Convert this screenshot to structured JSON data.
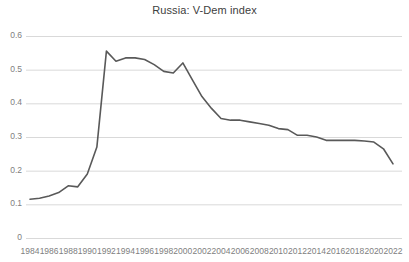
{
  "chart_data": {
    "type": "line",
    "title": "Russia: V-Dem index",
    "xlabel": "",
    "ylabel": "",
    "xlim": [
      1984,
      2022
    ],
    "ylim": [
      0,
      0.6
    ],
    "grid": true,
    "legend": false,
    "line_color": "#595959",
    "grid_color": "#d9d9d9",
    "tick_color": "#808080",
    "title_color": "#404040",
    "ytick_labels": [
      "0.6",
      "0.5",
      "0.4",
      "0.3",
      "0.2",
      "0.1",
      "0"
    ],
    "ytick_values": [
      0.6,
      0.5,
      0.4,
      0.3,
      0.2,
      0.1,
      0
    ],
    "xtick_labels": [
      "1984",
      "1986",
      "1988",
      "1990",
      "1992",
      "1994",
      "1996",
      "1998",
      "2000",
      "2002",
      "2004",
      "2006",
      "2008",
      "2010",
      "2012",
      "2014",
      "2016",
      "2018",
      "2020",
      "2022"
    ],
    "xtick_values": [
      1984,
      1986,
      1988,
      1990,
      1992,
      1994,
      1996,
      1998,
      2000,
      2002,
      2004,
      2006,
      2008,
      2010,
      2012,
      2014,
      2016,
      2018,
      2020,
      2022
    ],
    "x": [
      1984,
      1985,
      1986,
      1987,
      1988,
      1989,
      1990,
      1991,
      1992,
      1993,
      1994,
      1995,
      1996,
      1997,
      1998,
      1999,
      2000,
      2001,
      2002,
      2003,
      2004,
      2005,
      2006,
      2007,
      2008,
      2009,
      2010,
      2011,
      2012,
      2013,
      2014,
      2015,
      2016,
      2017,
      2018,
      2019,
      2020,
      2021,
      2022
    ],
    "values": [
      0.115,
      0.118,
      0.125,
      0.135,
      0.155,
      0.152,
      0.19,
      0.27,
      0.555,
      0.525,
      0.535,
      0.535,
      0.53,
      0.515,
      0.495,
      0.49,
      0.52,
      0.47,
      0.42,
      0.385,
      0.355,
      0.35,
      0.35,
      0.345,
      0.34,
      0.335,
      0.325,
      0.322,
      0.305,
      0.305,
      0.3,
      0.29,
      0.29,
      0.29,
      0.29,
      0.288,
      0.285,
      0.265,
      0.22
    ],
    "series_name": "V-Dem index"
  }
}
